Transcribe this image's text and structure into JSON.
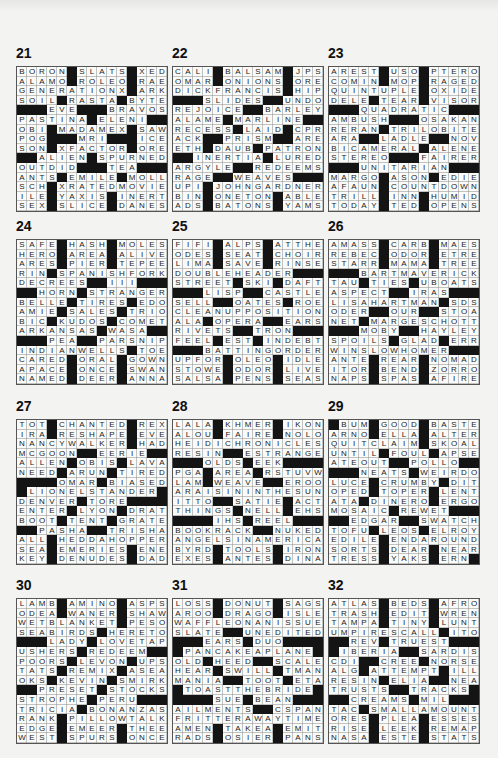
{
  "page": {
    "puzzles": [
      {
        "number": "21",
        "x": 16,
        "y": 45,
        "rows": [
          "BORON#SLATS#XED",
          "ALAMO#ROLEO#RAE",
          "GENERATIONX#ARK",
          "SOIL#RASTA#BYTE",
          "###EVE###BRAVOS",
          "PASTINA#ELENI##",
          "OBI#MADAMEX#SAW",
          "POG###MRI###ICE",
          "SON#XFACTOR#ORE",
          "##ALIEN#SPURNED",
          "OUTDID###TEA###",
          "ANTS#EMILE#MOLL",
          "SCH#XRATEDMOVIE",
          "ILE#YAXIS#INERT",
          "SEX#SLICE#DANES"
        ]
      },
      {
        "number": "22",
        "x": 172,
        "y": 45,
        "rows": [
          "CALI#BALSAM#JPS",
          "OMAR#ONIONS#ORE",
          "DICKFRANCIS#HIP",
          "###SLIDES##UNDO",
          "REJOICE##BARLEY",
          "ALAME#MARLINE##",
          "RECESS#LAID#CPR",
          "ACK##PRISM##ARE",
          "ETH#DAUB#PATRON",
          "##INERTIA#LURED",
          "ARGYLE##REDEEMS",
          "RAGE##WEAVES###",
          "UPI#JOHNGARDNER",
          "BIN#ONETON#ABLE",
          "ADS#BATONS#YAMS"
        ]
      },
      {
        "number": "23",
        "x": 328,
        "y": 45,
        "rows": [
          "AREST#USO#PTERO",
          "COMIN#MOP#RAGED",
          "QUINTUPLE#OXIDE",
          "DELE#TEAR#VISOR",
          "###QUADRATIC###",
          "AMBUSH###OSAKAN",
          "RERAN#TRILOBITE",
          "ARA##LADLE##NOV",
          "BICAMERAL#ALENE",
          "STEREO###FAIRER",
          "###UNITARIAN###",
          "MARGO#ASON#EDIE",
          "AFAUN#COUNTDOWN",
          "TRILL#INN#HUMID",
          "TODAY#TED#OPENS"
        ]
      },
      {
        "number": "24",
        "x": 16,
        "y": 218,
        "rows": [
          "SAFE#HASH#MOLES",
          "HERO#AREA#ALIVE",
          "ARES#PIER#TEPEE",
          "RIN#SPANISHFORK",
          "DECREES##III###",
          "##HORN#STRANGER",
          "BELLE#TIRES#EDO",
          "AMIE#SALES#TRIO",
          "BIC#KUDOS#COMET",
          "ARKANSAS#WASA##",
          "###PEA##PARSNIP",
          "INDIANWELLS#TOE",
          "CARED#ORAL#GOWN",
          "APACE#ONCE#SWAN",
          "NAMED#DEER#ANNA"
        ]
      },
      {
        "number": "25",
        "x": 172,
        "y": 218,
        "rows": [
          "FIFI#ALPS#ATTHE",
          "ODES#SEAT#CHOIR",
          "LIMA#SAVE#RINSE",
          "DOUBLEHEADER###",
          "STREET#SKI#DAFT",
          "###LISP##CASTLE",
          "SELL##OATES#ROE",
          "CLEANUPPOSITION",
          "ALA#OPERA##EARS",
          "RIVETS##TRON###",
          "FEEL#EST#INDEBT",
          "###BATTINGORDER",
          "UPFOR#OLEO#IDLE",
          "STOWE#ODOR#LIVE",
          "SALSA#PENS#SEAS"
        ]
      },
      {
        "number": "26",
        "x": 328,
        "y": 218,
        "rows": [
          "AMASS#CARB#MAES",
          "REBEC#ODOR#ETRE",
          "STARR#MAMA#TREE",
          "###BARTMAVERICK",
          "TAU#TIES#UBOATS",
          "ASPECT##IRAS###",
          "LISAHARTMAN#SDS",
          "ODER##OUR##STOA",
          "NET#MARGESCHOTT",
          "###MOBY##HAYLEY",
          "SPOILS#GLAD#ERR",
          "WINSLOWHOMER###",
          "ANTE#REAR#NOMAD",
          "ITOR#BEND#ZORRO",
          "NAPS#SPAS#AFIRE"
        ]
      },
      {
        "number": "27",
        "x": 16,
        "y": 398,
        "rows": [
          "TOT#CHANTED#REX",
          "IRA#RESHAPE#EVE",
          "NANCYWALKER#HAD",
          "MCGOON##EERIE##",
          "ALLEN#OBIS#LAVA",
          "NEED#ARUN#TIRED",
          "####OMAR#BIASED",
          "#LIONELSTANDER#",
          "DENVER#TORE####",
          "ENTER#LYON#DRAT",
          "BOOT#TENT#GRATE",
          "##PASHA##TRISHA",
          "ALL#HEDDAHOPPER",
          "SEA#EMERIES#ENE",
          "KEY#DENUDES#DAD"
        ]
      },
      {
        "number": "28",
        "x": 172,
        "y": 398,
        "rows": [
          "LALA#KHMER#IKON",
          "ALOU#FAIRE#NOLO",
          "HEIDICHRONICLES",
          "RESIN##ESTRANGE",
          "###OLDS#EEK####",
          "PGA#AREA#RSTUVW",
          "LAM#WEAVE##EROO",
          "ARAISININTHESUN",
          "ITTO##SATIE#ACT",
          "THINGS#NELL#EHS",
          "####IHS#REEL###",
          "BOOKRACK##NUKED",
          "ANGELSINAMERICA",
          "BYRD#TOOLS#IRON",
          "EXES#ANTES#DINA"
        ]
      },
      {
        "number": "29",
        "x": 328,
        "y": 398,
        "rows": [
          "#BUM#GOOD#BASTE",
          "ARNO#ELLA#ALTER",
          "QUITCLAIM#SKOAL",
          "UNTIL#FOUL#APSE",
          "ATEOUT##POLLO##",
          "###NEATS#WEIRDO",
          "LUCE#CRUMBY#DIT",
          "OPED#TOPER#LENT",
          "ATA#DINERO#ERGO",
          "MOSAIC#REWET###",
          "##EDGAR##SWATCH",
          "TOFU#LEOS#ELROY",
          "EDILE#ENDAROUND",
          "SORTS#DEAR#NEAR",
          "TRESS#YAKS#ERN#"
        ]
      },
      {
        "number": "30",
        "x": 16,
        "y": 577,
        "rows": [
          "LAMB#AMINO#ASPS",
          "ODEA#WANER#SHAW",
          "WETBLANKET#PESO",
          "SEABIRDS#HERETO",
          "###LADY#LOVETAP",
          "USHERS#REDEEM##",
          "POORS#LEVON#UPS",
          "TATS#REMIX#ASEA",
          "OKS#KEVIN#SMIRK",
          "##PRESET#STOCKS",
          "STROPHE#PERU###",
          "TRICIA#BONANZAS",
          "RANK#PILLOWTALK",
          "EDGE#EMEER#THEE",
          "WEST#SPURS#ONCE"
        ]
      },
      {
        "number": "31",
        "x": 172,
        "y": 577,
        "rows": [
          "LOSS#DONUT#SAGS",
          "AROO#DRAGO#ISLE",
          "WAFFLEONANISSUE",
          "SLATE##UNEDITED",
          "###EARS#DUO####",
          "#PANCAKEAPLANE#",
          "OLD#HEED##SCALE",
          "HEAR#SWILL#TMAN",
          "MANIA##TOOT#ETA",
          "#TOASTTHEBRIDE#",
          "####SUE#BEAN###",
          "AILMENTS##CSPAN",
          "FRITTERAWAYTIME",
          "AMEN#TAKEA#EMIT",
          "RADS#OSIER#PANS"
        ]
      },
      {
        "number": "32",
        "x": 328,
        "y": 577,
        "rows": [
          "ATLAS#BEDS#AFRO",
          "TRASH#EDIT#WREN",
          "TAMPA#TINY#LUNT",
          "UMPIRESCALL#ITO",
          "##REV#TRUEST###",
          "#IBERIA##SARDIS",
          "CDI##CREE#NORSE",
          "ALG#ATTEMPT#ILL",
          "RESIN#ELIA##NEA",
          "TRUSTS##TRACKS#",
          "##CREAMS#MIL###",
          "TAC#SMALLAMOUNT",
          "ORES#PLEA#ESSES",
          "RISE#LEEK#REMAP",
          "NASA#ESTE#STATS"
        ]
      }
    ]
  }
}
